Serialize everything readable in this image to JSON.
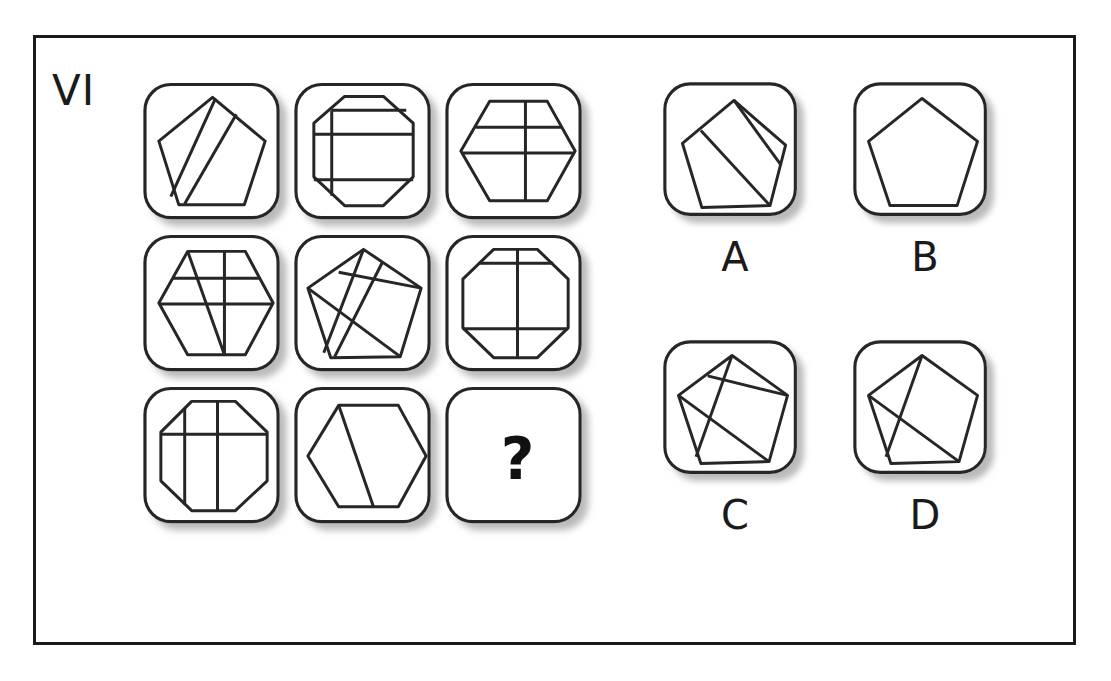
{
  "puzzle": {
    "label": "VI",
    "question_mark": "?"
  },
  "matrix": {
    "name": "3x3-matrix",
    "cells": [
      {
        "id": "cell-1",
        "position": "row1-col1",
        "shape": "pentagon",
        "description": "pentagon with two parallel diagonal bands",
        "lines": 2
      },
      {
        "id": "cell-2",
        "position": "row1-col2",
        "shape": "octagon",
        "description": "octagon with two horizontal lines and one vertical line",
        "lines": 3
      },
      {
        "id": "cell-3",
        "position": "row1-col3",
        "shape": "hexagon",
        "description": "hexagon with two horizontal lines and one vertical line",
        "lines": 3
      },
      {
        "id": "cell-4",
        "position": "row2-col1",
        "shape": "hexagon",
        "description": "hexagon with two horizontal lines, one vertical line and one diagonal",
        "lines": 4
      },
      {
        "id": "cell-5",
        "position": "row2-col2",
        "shape": "pentagon",
        "description": "pentagon with four crossing diagonal lines",
        "lines": 4
      },
      {
        "id": "cell-6",
        "position": "row2-col3",
        "shape": "octagon",
        "description": "octagon with two horizontal lines and one vertical line",
        "lines": 3
      },
      {
        "id": "cell-7",
        "position": "row3-col1",
        "shape": "octagon",
        "description": "octagon with two vertical lines and one horizontal line",
        "lines": 3
      },
      {
        "id": "cell-8",
        "position": "row3-col2",
        "shape": "hexagon",
        "description": "hexagon with one diagonal line",
        "lines": 1
      },
      {
        "id": "cell-9",
        "position": "row3-col3",
        "shape": "question",
        "description": "missing tile marked with a question mark",
        "lines": 0
      }
    ]
  },
  "options": [
    {
      "id": "option-a",
      "label": "A",
      "shape": "pentagon",
      "description": "pentagon with two parallel diagonal bands",
      "lines": 2
    },
    {
      "id": "option-b",
      "label": "B",
      "shape": "pentagon",
      "description": "plain pentagon with no internal lines",
      "lines": 0
    },
    {
      "id": "option-c",
      "label": "C",
      "shape": "pentagon",
      "description": "pentagon with three crossing internal lines",
      "lines": 3
    },
    {
      "id": "option-d",
      "label": "D",
      "shape": "pentagon",
      "description": "pentagon with two crossing diagonal lines forming an X",
      "lines": 2
    }
  ],
  "colors": {
    "stroke": "#262626",
    "frame": "#1a1a1a",
    "tile_fill": "#ffffff",
    "shadow": "#8a8a8a",
    "background": "#ffffff"
  }
}
